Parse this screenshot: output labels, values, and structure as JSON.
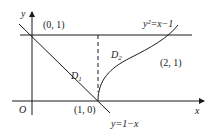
{
  "diagram": {
    "axes": {
      "x_label": "x",
      "y_label": "y",
      "origin_label": "O"
    },
    "points": [
      {
        "label": "(0, 1)"
      },
      {
        "label": "(1, 0)"
      },
      {
        "label": "(2, 1)"
      }
    ],
    "curves": [
      {
        "label": "y²=x−1"
      },
      {
        "label": "y=1−x"
      }
    ],
    "regions": [
      {
        "label": "D",
        "sub": "1"
      },
      {
        "label": "D",
        "sub": "2"
      }
    ]
  }
}
